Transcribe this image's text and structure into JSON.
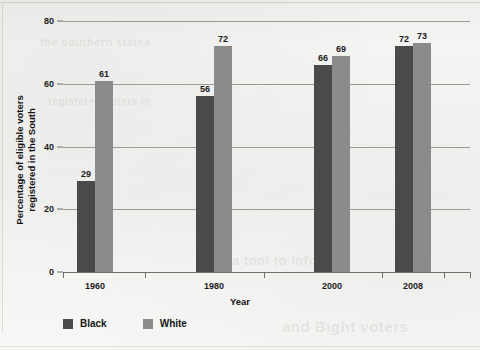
{
  "chart_data": {
    "type": "bar",
    "title": "",
    "xlabel": "Year",
    "ylabel_line1": "Percentage of eligible voters",
    "ylabel_line2": "registered in the South",
    "categories": [
      "1960",
      "1980",
      "2000",
      "2008"
    ],
    "series": [
      {
        "name": "Black",
        "color": "#4a4a4a",
        "values": [
          29,
          56,
          66,
          72
        ]
      },
      {
        "name": "White",
        "color": "#8b8b8b",
        "values": [
          61,
          72,
          69,
          73
        ]
      }
    ],
    "ylim": [
      0,
      80
    ],
    "yticks": [
      0,
      20,
      40,
      60,
      80
    ],
    "ytick_labels": [
      "0",
      "20",
      "40",
      "60",
      "80"
    ],
    "grid": true,
    "legend_position": "bottom-left",
    "data_labels": true
  },
  "ghost_text": [
    {
      "text": "a tool to inform",
      "x": 232,
      "y": 253,
      "size": 13
    },
    {
      "text": "and Bight voters",
      "x": 282,
      "y": 318,
      "size": 15
    },
    {
      "text": "the southern states",
      "x": 40,
      "y": 36,
      "size": 11
    },
    {
      "text": "registered voters in",
      "x": 48,
      "y": 96,
      "size": 10
    }
  ]
}
